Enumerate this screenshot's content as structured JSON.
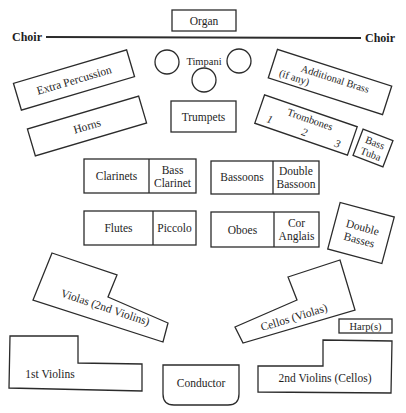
{
  "stage": {
    "choir_left": "Choir",
    "choir_right": "Choir",
    "organ": "Organ"
  },
  "percussion": {
    "timpani": "Timpani",
    "extra_percussion": "Extra Percussion"
  },
  "brass": {
    "horns": "Horns",
    "trumpets": "Trumpets",
    "additional_brass": [
      "Additional Brass",
      "(if any)"
    ],
    "trombones": {
      "label": "Trombones",
      "chairs": [
        "1",
        "2",
        "3"
      ]
    },
    "bass_tuba": [
      "Bass",
      "Tuba"
    ]
  },
  "woodwinds": {
    "clarinets": {
      "main": "Clarinets",
      "sub": [
        "Bass",
        "Clarinet"
      ]
    },
    "bassoons": {
      "main": "Bassoons",
      "sub": [
        "Double",
        "Bassoon"
      ]
    },
    "flutes": {
      "main": "Flutes",
      "sub": [
        "Piccolo"
      ]
    },
    "oboes": {
      "main": "Oboes",
      "sub": [
        "Cor",
        "Anglais"
      ]
    }
  },
  "strings": {
    "double_basses": [
      "Double",
      "Basses"
    ],
    "violas": "Violas (2nd Violins)",
    "cellos": "Cellos (Violas)",
    "harps": "Harp(s)",
    "first_violins": "1st Violins",
    "second_violins": "2nd Violins (Cellos)"
  },
  "podium": {
    "conductor": "Conductor"
  },
  "colors": {
    "ink": "#2b2b2b",
    "paper": "#ffffff"
  }
}
